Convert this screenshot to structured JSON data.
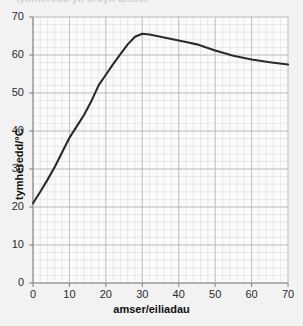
{
  "figure": {
    "cut_off_header": "tymheredd yn erbyn amser",
    "background_color": "#f2f2f2",
    "plot_background_color": "#fbfbfb",
    "grid_minor_color": "#dcdcdc",
    "grid_major_color": "#bdbdbd",
    "axis_color": "#8a8a8a",
    "line_color": "#2b2b2b"
  },
  "chart_data": {
    "type": "line",
    "title": "",
    "xlabel": "amser/eiliadau",
    "ylabel": "tymheredd/°C",
    "xlim": [
      0,
      70
    ],
    "ylim": [
      0,
      70
    ],
    "xticks": [
      0,
      10,
      20,
      30,
      40,
      50,
      60,
      70
    ],
    "yticks": [
      0,
      10,
      20,
      30,
      40,
      50,
      60,
      70
    ],
    "xtick_labels": [
      "0",
      "10",
      "20",
      "30",
      "40",
      "50",
      "60",
      "70"
    ],
    "ytick_labels": [
      "0",
      "10",
      "20",
      "30",
      "40",
      "50",
      "60",
      "70"
    ],
    "grid": true,
    "minor_grid_step": 2,
    "legend": null,
    "series": [
      {
        "name": "tymheredd",
        "x": [
          0,
          2,
          4,
          6,
          8,
          10,
          12,
          14,
          16,
          18,
          20,
          22,
          24,
          26,
          28,
          30,
          32,
          34,
          36,
          38,
          40,
          42,
          45,
          50,
          55,
          60,
          65,
          70
        ],
        "y": [
          21.0,
          24.0,
          27.2,
          30.6,
          34.4,
          38.2,
          41.2,
          44.2,
          47.8,
          52.0,
          54.8,
          57.6,
          60.2,
          62.8,
          64.8,
          65.6,
          65.4,
          65.0,
          64.6,
          64.2,
          63.8,
          63.4,
          62.8,
          61.2,
          59.8,
          58.8,
          58.1,
          57.5
        ]
      }
    ]
  }
}
